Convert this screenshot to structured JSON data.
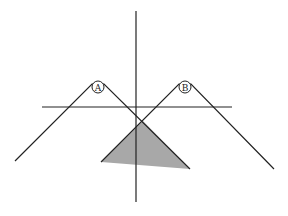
{
  "diagram": {
    "colors": {
      "stroke": "#222222",
      "shade": "#a8a8a8",
      "background": "#ffffff"
    },
    "labels": [
      {
        "id": "A",
        "text": "A",
        "cx": 98,
        "cy": 87,
        "r": 6
      },
      {
        "id": "B",
        "text": "B",
        "cx": 185,
        "cy": 87,
        "r": 6
      }
    ],
    "axes": {
      "vertical": {
        "x": 136,
        "y1": 11,
        "y2": 202
      },
      "horizontal": {
        "y": 107,
        "x1": 42,
        "x2": 232
      }
    },
    "wedges": [
      {
        "id": "A",
        "left": [
          15,
          161
        ],
        "apex_left": [
          92,
          84
        ],
        "apex_right": [
          104,
          84
        ],
        "right": [
          190,
          169
        ]
      },
      {
        "id": "B",
        "left": [
          101,
          162
        ],
        "apex_left": [
          179,
          84
        ],
        "apex_right": [
          191,
          84
        ],
        "right": [
          274,
          169
        ]
      }
    ],
    "shaded_region": {
      "points": [
        [
          101,
          162
        ],
        [
          143,
          121
        ],
        [
          190,
          169
        ]
      ]
    }
  }
}
